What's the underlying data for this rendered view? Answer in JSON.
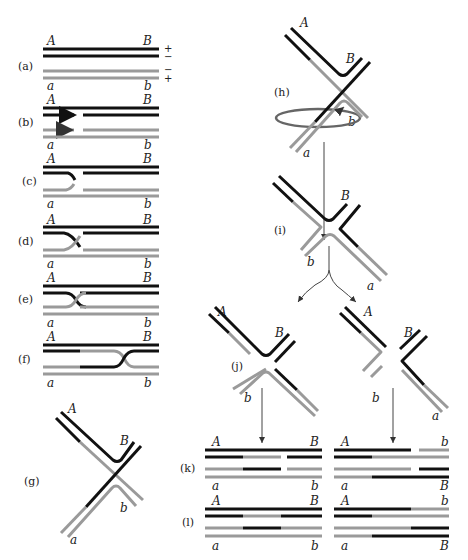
{
  "figure": {
    "colors": {
      "strand_dark": "#111111",
      "strand_light": "#9a9a9a"
    },
    "panels": {
      "a": {
        "label": "(a)",
        "top_left": "A",
        "top_right": "B",
        "bottom_left": "a",
        "bottom_right": "b",
        "signs": [
          "+",
          "−",
          "−",
          "+"
        ]
      },
      "b": {
        "label": "(b)",
        "top_left": "A",
        "top_right": "B",
        "bottom_left": "a",
        "bottom_right": "b"
      },
      "c": {
        "label": "(c)",
        "top_left": "A",
        "top_right": "B",
        "bottom_left": "a",
        "bottom_right": "b"
      },
      "d": {
        "label": "(d)",
        "top_left": "A",
        "top_right": "B",
        "bottom_left": "a",
        "bottom_right": "b"
      },
      "e": {
        "label": "(e)",
        "top_left": "A",
        "top_right": "B",
        "bottom_left": "a",
        "bottom_right": "b"
      },
      "f": {
        "label": "(f)",
        "top_left": "A",
        "top_right": "B",
        "bottom_left": "a",
        "bottom_right": "b"
      },
      "g": {
        "label": "(g)",
        "A": "A",
        "B": "B",
        "b": "b",
        "a": "a"
      },
      "h": {
        "label": "(h)",
        "A": "A",
        "B": "B",
        "b": "b",
        "a": "a"
      },
      "i": {
        "label": "(i)",
        "B": "B",
        "b": "b",
        "a": "a"
      },
      "j": {
        "label": "(j)",
        "left": {
          "A": "A",
          "B": "B",
          "b": "b",
          "a": "a"
        },
        "right": {
          "A": "A",
          "b": "b",
          "a": "a"
        }
      },
      "k": {
        "label": "(k)",
        "left": {
          "top_left": "A",
          "top_right": "B",
          "bottom_left": "a",
          "bottom_right": "b"
        },
        "right": {
          "top_left": "A",
          "top_right": "b",
          "bottom_left": "a",
          "bottom_right": "B"
        }
      },
      "l": {
        "label": "(l)",
        "left": {
          "top_left": "A",
          "top_right": "B",
          "bottom_left": "a",
          "bottom_right": "b"
        },
        "right": {
          "top_left": "A",
          "top_right": "b",
          "bottom_left": "a",
          "bottom_right": "B"
        }
      }
    }
  }
}
